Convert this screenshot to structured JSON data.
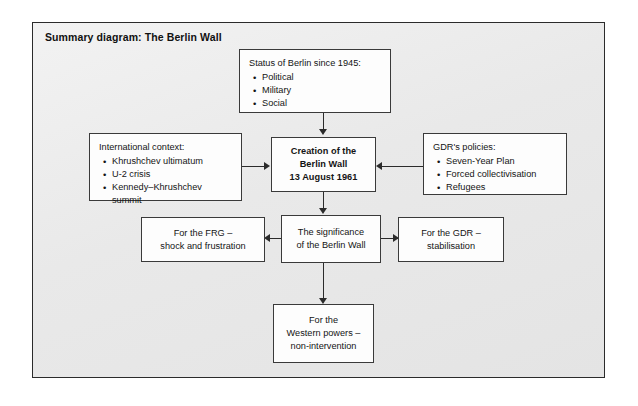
{
  "diagram": {
    "title": "Summary diagram: The Berlin Wall",
    "nodes": {
      "status_of_berlin": {
        "heading": "Status of Berlin since 1945:",
        "bullets": [
          "Political",
          "Military",
          "Social"
        ]
      },
      "international_context": {
        "heading": "International context:",
        "bullets": [
          "Khrushchev ultimatum",
          "U-2 crisis",
          "Kennedy–Khrushchev summit"
        ]
      },
      "gdr_policies": {
        "heading": "GDR's policies:",
        "bullets": [
          "Seven-Year Plan",
          "Forced collectivisation",
          "Refugees"
        ]
      },
      "creation": {
        "line1": "Creation of the",
        "line2": "Berlin Wall",
        "line3": "13 August 1961"
      },
      "significance": {
        "line1": "The significance",
        "line2": "of the Berlin Wall"
      },
      "frg_outcome": {
        "line1": "For the FRG –",
        "line2": "shock and frustration"
      },
      "gdr_outcome": {
        "line1": "For the GDR –",
        "line2": "stabilisation"
      },
      "western_powers_outcome": {
        "line1": "For the",
        "line2": "Western powers –",
        "line3": "non-intervention"
      }
    },
    "colors": {
      "panel_background": "#ececec",
      "panel_border": "#2b2b2b",
      "node_background": "#fdfdfd",
      "node_border": "#3a3a3a",
      "connector": "#2b2b2b",
      "text": "#141414"
    }
  }
}
